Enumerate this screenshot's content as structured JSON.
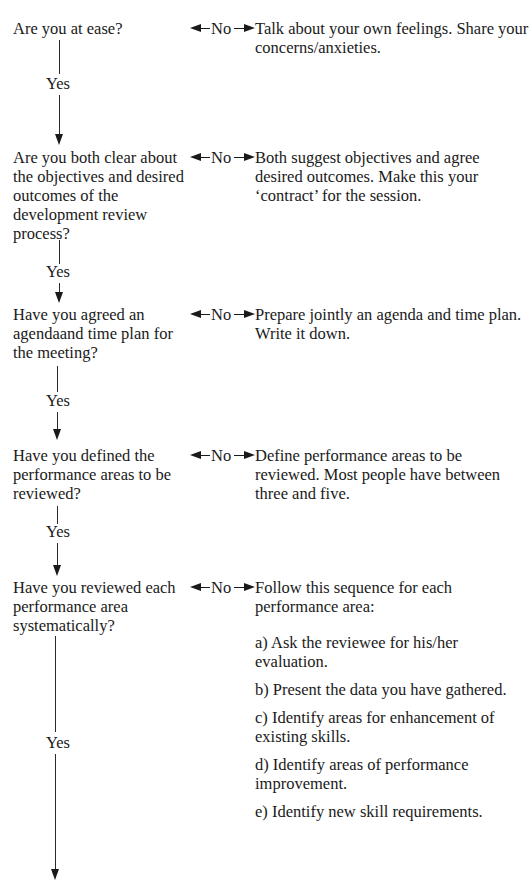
{
  "flow": {
    "yes_label": "Yes",
    "no_label": "No",
    "steps": [
      {
        "question": "Are you at ease?",
        "answer": [
          "Talk about your own feelings. Share your concerns/anxieties."
        ]
      },
      {
        "question": "Are you both clear about the objectives and desired outcomes of the development review process?",
        "answer": [
          "Both suggest objectives and agree desired outcomes. Make this your ‘contract’ for the session."
        ]
      },
      {
        "question": "Have you agreed an agendaand time plan for the meeting?",
        "answer": [
          "Prepare jointly an agenda and time plan. Write it down."
        ]
      },
      {
        "question": "Have you defined the performance areas to be reviewed?",
        "answer": [
          "Define performance areas to be reviewed. Most people have between three and five."
        ]
      },
      {
        "question": "Have you reviewed each performance area systematically?",
        "answer": [
          "Follow this sequence for each performance area:",
          "a) Ask the reviewee for his/her evaluation.",
          "b) Present the data you have gathered.",
          "c) Identify areas for enhancement of existing skills.",
          "d) Identify areas of performance improvement.",
          "e) Identify new skill requirements."
        ]
      }
    ]
  }
}
